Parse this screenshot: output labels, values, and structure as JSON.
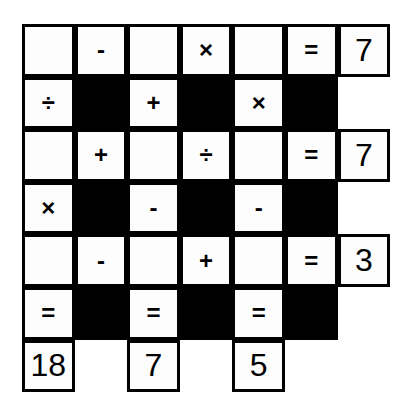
{
  "puzzle": {
    "rows": 7,
    "cols": 7,
    "grid": [
      [
        {
          "t": "empty",
          "v": ""
        },
        {
          "t": "op",
          "v": "-"
        },
        {
          "t": "empty",
          "v": ""
        },
        {
          "t": "op",
          "v": "×"
        },
        {
          "t": "empty",
          "v": ""
        },
        {
          "t": "op",
          "v": "="
        },
        {
          "t": "num",
          "v": "7"
        }
      ],
      [
        {
          "t": "op",
          "v": "÷"
        },
        {
          "t": "black",
          "v": ""
        },
        {
          "t": "op",
          "v": "+"
        },
        {
          "t": "black",
          "v": ""
        },
        {
          "t": "op",
          "v": "×"
        },
        {
          "t": "black",
          "v": ""
        },
        {
          "t": "none",
          "v": ""
        }
      ],
      [
        {
          "t": "empty",
          "v": ""
        },
        {
          "t": "op",
          "v": "+"
        },
        {
          "t": "empty",
          "v": ""
        },
        {
          "t": "op",
          "v": "÷"
        },
        {
          "t": "empty",
          "v": ""
        },
        {
          "t": "op",
          "v": "="
        },
        {
          "t": "num",
          "v": "7"
        }
      ],
      [
        {
          "t": "op",
          "v": "×"
        },
        {
          "t": "black",
          "v": ""
        },
        {
          "t": "op",
          "v": "-"
        },
        {
          "t": "black",
          "v": ""
        },
        {
          "t": "op",
          "v": "-"
        },
        {
          "t": "black",
          "v": ""
        },
        {
          "t": "none",
          "v": ""
        }
      ],
      [
        {
          "t": "empty",
          "v": ""
        },
        {
          "t": "op",
          "v": "-"
        },
        {
          "t": "empty",
          "v": ""
        },
        {
          "t": "op",
          "v": "+"
        },
        {
          "t": "empty",
          "v": ""
        },
        {
          "t": "op",
          "v": "="
        },
        {
          "t": "num",
          "v": "3"
        }
      ],
      [
        {
          "t": "op",
          "v": "="
        },
        {
          "t": "black",
          "v": ""
        },
        {
          "t": "op",
          "v": "="
        },
        {
          "t": "black",
          "v": ""
        },
        {
          "t": "op",
          "v": "="
        },
        {
          "t": "black",
          "v": ""
        },
        {
          "t": "none",
          "v": ""
        }
      ],
      [
        {
          "t": "num",
          "v": "18"
        },
        {
          "t": "none",
          "v": ""
        },
        {
          "t": "num",
          "v": "7"
        },
        {
          "t": "none",
          "v": ""
        },
        {
          "t": "num",
          "v": "5"
        },
        {
          "t": "none",
          "v": ""
        },
        {
          "t": "none",
          "v": ""
        }
      ]
    ],
    "row_results": [
      "7",
      "7",
      "3"
    ],
    "column_results": [
      "18",
      "7",
      "5"
    ]
  }
}
